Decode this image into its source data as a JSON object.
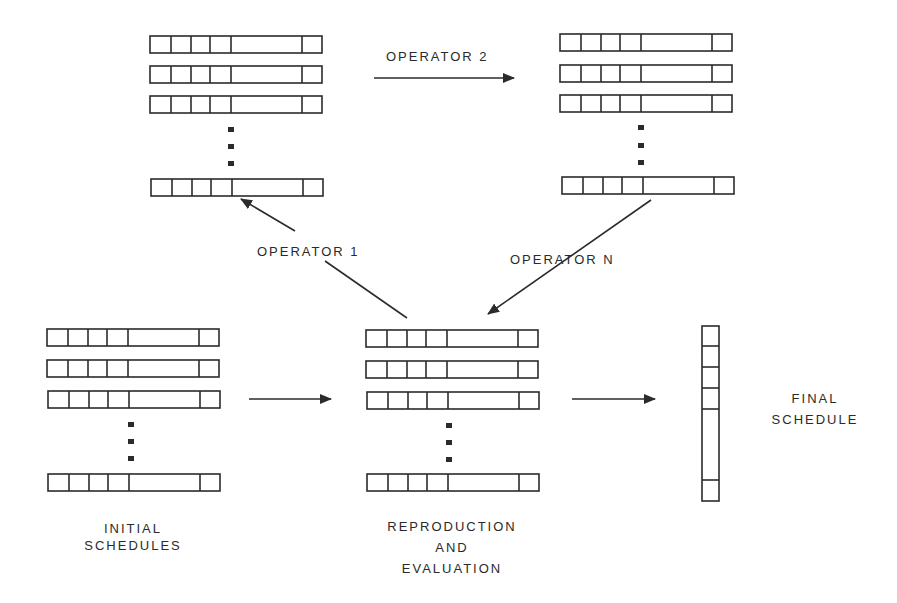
{
  "diagram": {
    "type": "genetic-algorithm-flow",
    "groups": {
      "operator_2_input": {
        "rows_shown": 3,
        "has_ellipsis": true,
        "has_last_row": true
      },
      "operator_2_output": {
        "rows_shown": 3,
        "has_ellipsis": true,
        "has_last_row": true
      },
      "initial_schedules": {
        "rows_shown": 3,
        "has_ellipsis": true,
        "has_last_row": true
      },
      "reproduction_pool": {
        "rows_shown": 3,
        "has_ellipsis": true,
        "has_last_row": true
      },
      "final_schedule": {
        "orientation": "vertical",
        "cells": 6
      }
    },
    "edges": [
      {
        "from": "operator_2_input",
        "to": "operator_2_output",
        "label": "OPERATOR 2"
      },
      {
        "from": "reproduction_pool",
        "to": "operator_2_input",
        "label": "OPERATOR 1"
      },
      {
        "from": "operator_2_output",
        "to": "reproduction_pool",
        "label": "OPERATOR N"
      },
      {
        "from": "initial_schedules",
        "to": "reproduction_pool",
        "label": ""
      },
      {
        "from": "reproduction_pool",
        "to": "final_schedule",
        "label": ""
      }
    ]
  },
  "labels": {
    "operator_2": "OPERATOR 2",
    "operator_1": "OPERATOR 1",
    "operator_n": "OPERATOR N",
    "initial_line1": "INITIAL",
    "initial_line2": "SCHEDULES",
    "repro_line1": "REPRODUCTION",
    "repro_line2": "AND",
    "repro_line3": "EVALUATION",
    "final_line1": "FINAL",
    "final_line2": "SCHEDULE"
  },
  "colors": {
    "ink": "#2b2b2b",
    "background": "#ffffff"
  }
}
